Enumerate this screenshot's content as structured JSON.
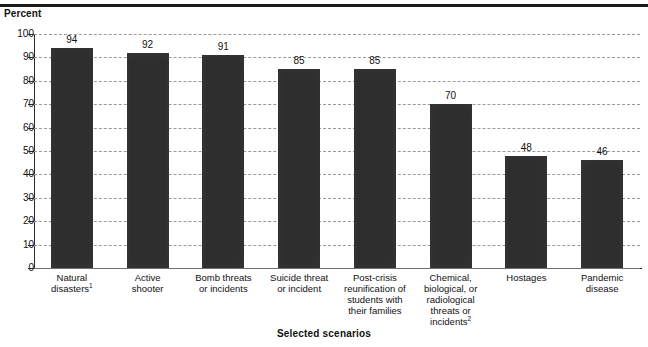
{
  "top_rule": "",
  "axis": {
    "y_title": "Percent",
    "x_title": "Selected scenarios",
    "y_ticks": [
      "100",
      "90",
      "80",
      "70",
      "60",
      "50",
      "40",
      "30",
      "20",
      "10",
      "0"
    ]
  },
  "chart_data": {
    "type": "bar",
    "title": "",
    "subtitle": "",
    "xlabel": "Selected scenarios",
    "ylabel": "Percent",
    "ylim": [
      0,
      100
    ],
    "ytick_step": 10,
    "grid": true,
    "legend": "none",
    "orientation": "vertical",
    "bar_color": "#2e2e2e",
    "categories": [
      "Natural disasters",
      "Active shooter",
      "Bomb threats or incidents",
      "Suicide threat or incident",
      "Post-crisis reunification of students with their families",
      "Chemical, biological, or radiological threats or incidents",
      "Hostages",
      "Pandemic disease"
    ],
    "category_lines": [
      [
        "Natural",
        "disasters"
      ],
      [
        "Active",
        "shooter"
      ],
      [
        "Bomb threats",
        "or incidents"
      ],
      [
        "Suicide threat",
        "or incident"
      ],
      [
        "Post-crisis",
        "reunification of",
        "students with",
        "their families"
      ],
      [
        "Chemical,",
        "biological, or",
        "radiological",
        "threats or",
        "incidents"
      ],
      [
        "Hostages"
      ],
      [
        "Pandemic",
        "disease"
      ]
    ],
    "category_footnotes": [
      "1",
      "",
      "",
      "",
      "",
      "2",
      "",
      ""
    ],
    "values": [
      94,
      92,
      91,
      85,
      85,
      70,
      48,
      46
    ],
    "value_labels": [
      "94",
      "92",
      "91",
      "85",
      "85",
      "70",
      "48",
      "46"
    ]
  }
}
